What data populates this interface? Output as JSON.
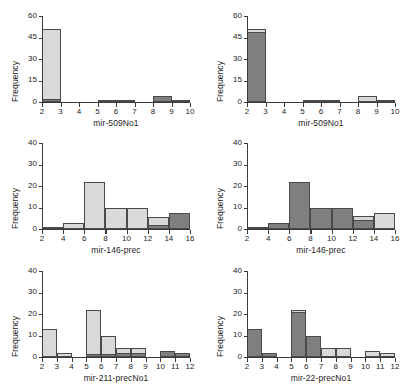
{
  "figure": {
    "colors": {
      "light_fill": "#d9d9d9",
      "dark_fill": "#7f7f7f",
      "bar_outline": "#4a4a4a",
      "axis": "#3a3a3a",
      "text": "#1c1c1c",
      "background": "#ffffff"
    },
    "ylabel": "Frequency"
  },
  "chart_data": [
    {
      "id": "panel-top-left",
      "type": "bar",
      "title": "",
      "xlabel": "mir-509No1",
      "ylabel": "Frequency",
      "xlim": [
        2,
        10
      ],
      "ylim": [
        0,
        60
      ],
      "xticks": [
        2,
        3,
        4,
        5,
        6,
        7,
        8,
        9,
        10
      ],
      "yticks": [
        0,
        15,
        30,
        45,
        60
      ],
      "grid": false,
      "legend": "none",
      "bin_width": 1,
      "categories": [
        "2-3",
        "3-4",
        "4-5",
        "5-6",
        "6-7",
        "7-8",
        "8-9",
        "9-10"
      ],
      "series": [
        {
          "name": "light",
          "color": "#d9d9d9",
          "values": [
            51,
            0,
            0,
            1,
            1,
            0,
            0,
            0
          ]
        },
        {
          "name": "dark",
          "color": "#7f7f7f",
          "values": [
            2,
            0,
            0,
            0,
            0,
            0,
            4,
            1
          ]
        }
      ]
    },
    {
      "id": "panel-top-right",
      "type": "bar",
      "title": "",
      "xlabel": "mir-509No1",
      "ylabel": "Frequency",
      "xlim": [
        2,
        10
      ],
      "ylim": [
        0,
        60
      ],
      "xticks": [
        2,
        3,
        4,
        5,
        6,
        7,
        8,
        9,
        10
      ],
      "yticks": [
        0,
        15,
        30,
        45,
        60
      ],
      "grid": false,
      "legend": "none",
      "bin_width": 1,
      "categories": [
        "2-3",
        "3-4",
        "4-5",
        "5-6",
        "6-7",
        "7-8",
        "8-9",
        "9-10"
      ],
      "series": [
        {
          "name": "dark",
          "color": "#7f7f7f",
          "values": [
            49,
            0,
            0,
            1,
            1,
            0,
            0,
            0
          ]
        },
        {
          "name": "light",
          "color": "#d9d9d9",
          "values": [
            51,
            0,
            0,
            0,
            0,
            0,
            4,
            1
          ]
        }
      ]
    },
    {
      "id": "panel-middle-left",
      "type": "bar",
      "title": "",
      "xlabel": "mir-146-prec",
      "ylabel": "Frequency",
      "xlim": [
        2,
        16
      ],
      "ylim": [
        0,
        40
      ],
      "xticks": [
        2,
        4,
        6,
        8,
        10,
        12,
        14,
        16
      ],
      "yticks": [
        0,
        10,
        20,
        30,
        40
      ],
      "grid": false,
      "legend": "none",
      "bin_width": 2,
      "categories": [
        "2-4",
        "4-6",
        "6-8",
        "8-10",
        "10-12",
        "12-14",
        "14-16"
      ],
      "series": [
        {
          "name": "light",
          "color": "#d9d9d9",
          "values": [
            1,
            3,
            22,
            10,
            10,
            5.5,
            0
          ]
        },
        {
          "name": "dark",
          "color": "#7f7f7f",
          "values": [
            0,
            0,
            0,
            0,
            0,
            2,
            7.5
          ]
        }
      ]
    },
    {
      "id": "panel-middle-right",
      "type": "bar",
      "title": "",
      "xlabel": "mir-146-prec",
      "ylabel": "Frequency",
      "xlim": [
        2,
        16
      ],
      "ylim": [
        0,
        40
      ],
      "xticks": [
        2,
        4,
        6,
        8,
        10,
        12,
        14,
        16
      ],
      "yticks": [
        0,
        10,
        20,
        30,
        40
      ],
      "grid": false,
      "legend": "none",
      "bin_width": 2,
      "categories": [
        "2-4",
        "4-6",
        "6-8",
        "8-10",
        "10-12",
        "12-14",
        "14-16"
      ],
      "series": [
        {
          "name": "dark",
          "color": "#7f7f7f",
          "values": [
            1,
            3,
            22,
            10,
            10,
            4,
            0
          ]
        },
        {
          "name": "light",
          "color": "#d9d9d9",
          "values": [
            0,
            0,
            0,
            0,
            0,
            6,
            7.5
          ]
        }
      ]
    },
    {
      "id": "panel-bottom-left",
      "type": "bar",
      "title": "",
      "xlabel": "mir-211-precNo1",
      "ylabel": "Frequency",
      "xlim": [
        2,
        12
      ],
      "ylim": [
        0,
        40
      ],
      "xticks": [
        2,
        3,
        4,
        5,
        6,
        7,
        8,
        9,
        10,
        11,
        12
      ],
      "yticks": [
        0,
        10,
        20,
        30,
        40
      ],
      "grid": false,
      "legend": "none",
      "bin_width": 1,
      "categories": [
        "2-3",
        "3-4",
        "4-5",
        "5-6",
        "6-7",
        "7-8",
        "8-9",
        "9-10",
        "10-11",
        "11-12"
      ],
      "series": [
        {
          "name": "light",
          "color": "#d9d9d9",
          "values": [
            13,
            2,
            0,
            22,
            10,
            4,
            4,
            0,
            0,
            0
          ]
        },
        {
          "name": "dark",
          "color": "#7f7f7f",
          "values": [
            0,
            0,
            0,
            1.5,
            1.5,
            2,
            2,
            0,
            3,
            2
          ]
        }
      ]
    },
    {
      "id": "panel-bottom-right",
      "type": "bar",
      "title": "",
      "xlabel": "mir-22-precNo1",
      "ylabel": "Frequency",
      "xlim": [
        2,
        12
      ],
      "ylim": [
        0,
        40
      ],
      "xticks": [
        2,
        3,
        4,
        5,
        6,
        7,
        8,
        9,
        10,
        11,
        12
      ],
      "yticks": [
        0,
        10,
        20,
        30,
        40
      ],
      "grid": false,
      "legend": "none",
      "bin_width": 1,
      "categories": [
        "2-3",
        "3-4",
        "4-5",
        "5-6",
        "6-7",
        "7-8",
        "8-9",
        "9-10",
        "10-11",
        "11-12"
      ],
      "series": [
        {
          "name": "dark",
          "color": "#7f7f7f",
          "values": [
            13,
            2,
            0,
            21,
            10,
            0,
            0,
            0,
            0,
            0
          ]
        },
        {
          "name": "light",
          "color": "#d9d9d9",
          "values": [
            0,
            0,
            0,
            22,
            0,
            4,
            4,
            0,
            3,
            2
          ]
        }
      ]
    }
  ]
}
